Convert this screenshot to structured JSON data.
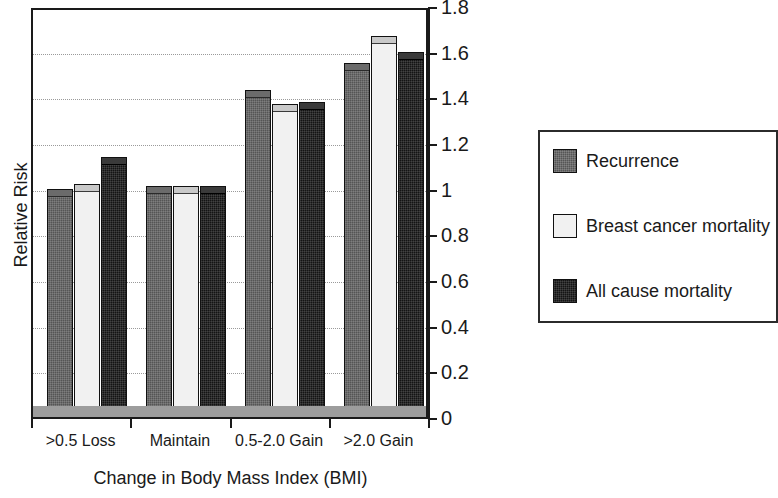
{
  "chart_data": {
    "type": "bar",
    "title": "",
    "xlabel": "Change in Body Mass Index (BMI)",
    "ylabel": "Relative Risk",
    "categories": [
      ">0.5 Loss",
      "Maintain",
      "0.5-2.0 Gain",
      ">2.0 Gain"
    ],
    "series": [
      {
        "name": "Recurrence",
        "color": "#555555",
        "values": [
          1.0,
          1.01,
          1.43,
          1.55
        ]
      },
      {
        "name": "Breast cancer mortality",
        "color": "#f1f1f1",
        "values": [
          1.02,
          1.01,
          1.37,
          1.67
        ]
      },
      {
        "name": "All cause mortality",
        "color": "#141414",
        "values": [
          1.14,
          1.01,
          1.38,
          1.6
        ]
      }
    ],
    "ylim": [
      0,
      1.8
    ],
    "y_ticks": [
      0,
      0.2,
      0.4,
      0.6,
      0.8,
      1,
      1.2,
      1.4,
      1.6,
      1.8
    ],
    "y_tick_labels": [
      "0",
      "0.2",
      "0.4",
      "0.6",
      "0.8",
      "1",
      "1.2",
      "1.4",
      "1.6",
      "1.8"
    ],
    "grid": true,
    "grid_axis": "y",
    "y_axis_position": "right",
    "legend_position": "right",
    "legend_entries": [
      "Recurrence",
      "Breast cancer mortality",
      "All cause mortality"
    ]
  }
}
